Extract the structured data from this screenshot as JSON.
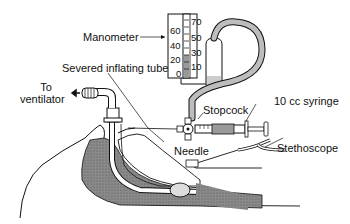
{
  "diagram": {
    "labels": {
      "manometer": "Manometer",
      "severed_tube": "Severed inflating tube",
      "to_ventilator_line1": "To",
      "to_ventilator_line2": "ventilator",
      "stopcock": "Stopcock",
      "syringe": "10 cc syringe",
      "needle": "Needle",
      "stethoscope": "Stethoscope"
    },
    "manometer_scale_left": [
      "60",
      "40",
      "20",
      "0"
    ],
    "manometer_scale_right": [
      "70",
      "50",
      "30",
      "10"
    ],
    "colors": {
      "line": "#111111",
      "shading": "#7a7a7a",
      "background": "#ffffff"
    }
  }
}
